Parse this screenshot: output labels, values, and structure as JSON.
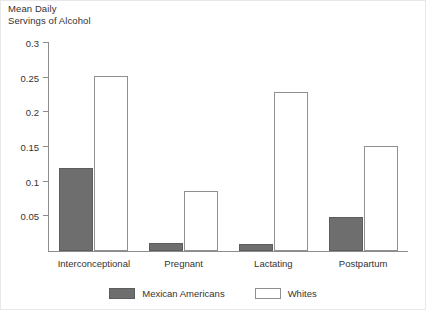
{
  "chart_data": {
    "type": "bar",
    "title": "Mean Daily Servings of Alcohol",
    "title_line1": "Mean Daily",
    "title_line2": "Servings of Alcohol",
    "xlabel": "",
    "ylabel": "",
    "ylim": [
      0,
      0.3
    ],
    "yticks": [
      "0.05",
      "0.1",
      "0.15",
      "0.2",
      "0.25",
      "0.3"
    ],
    "ytick_values": [
      0.05,
      0.1,
      0.15,
      0.2,
      0.25,
      0.3
    ],
    "grid": false,
    "legend_position": "bottom-center",
    "categories": [
      "Interconceptional",
      "Pregnant",
      "Lactating",
      "Postpartum"
    ],
    "series": [
      {
        "name": "Mexican Americans",
        "color": "#6e6e6e",
        "values": [
          0.12,
          0.012,
          0.01,
          0.049
        ]
      },
      {
        "name": "Whites",
        "color": "#ffffff",
        "values": [
          0.253,
          0.086,
          0.229,
          0.152
        ]
      }
    ]
  },
  "legend": {
    "items": [
      {
        "label": "Mexican Americans",
        "swatch": "filled-gray-swatch"
      },
      {
        "label": "Whites",
        "swatch": "outlined-white-swatch"
      }
    ]
  },
  "colors": {
    "series_mexican_americans": "#6e6e6e",
    "series_whites": "#ffffff",
    "axis": "#8c8c8c",
    "text": "#333333",
    "background": "#ffffff"
  }
}
